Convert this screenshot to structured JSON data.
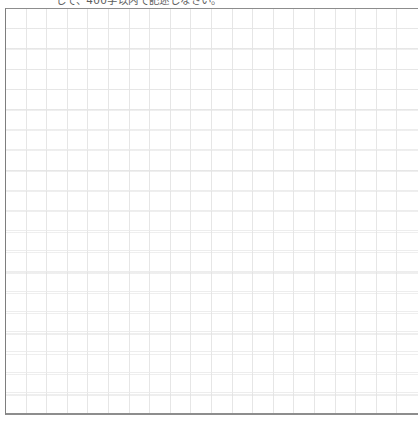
{
  "document": {
    "kind": "japanese-manuscript-paper",
    "instruction_text": "して、400字以内で記述しなさい。",
    "grid": {
      "columns": 20,
      "rows": 20,
      "total_cells": 400,
      "cell_border_color": "#e6e6e6",
      "frame_border_color": "#8d8d8d",
      "background_color": "#ffffff"
    }
  }
}
